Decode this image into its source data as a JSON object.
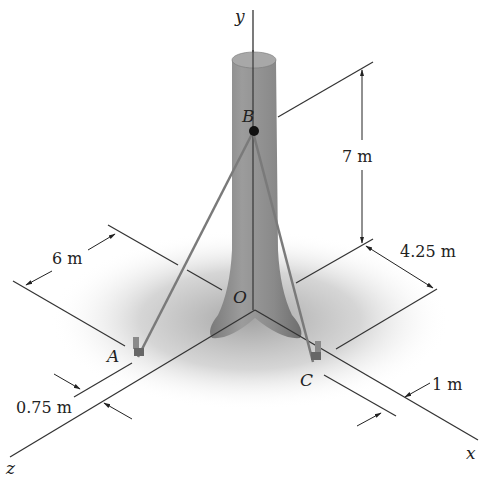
{
  "figure": {
    "axes": {
      "x_label": "x",
      "y_label": "y",
      "z_label": "z",
      "origin_label": "O"
    },
    "points": {
      "A": "A",
      "B": "B",
      "C": "C"
    },
    "dimensions": {
      "height_B": "7 m",
      "dist_x_guide": "4.25 m",
      "dist_z_guide": "6 m",
      "offset_A": "0.75 m",
      "offset_C": "1 m"
    },
    "colors": {
      "trunk": "#8a8a8a",
      "trunk_top": "#a8a8a8",
      "ground_shadow": "#c8c8c8",
      "lines": "#333333",
      "cable": "#7a7a7a"
    }
  }
}
